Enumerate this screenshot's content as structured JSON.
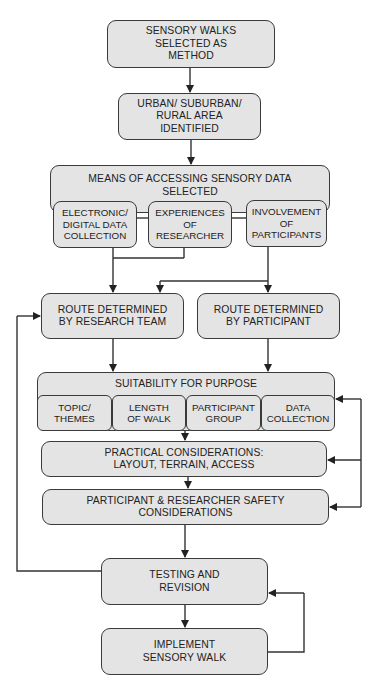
{
  "diagram": {
    "type": "flowchart",
    "nodes": {
      "n1": "SENSORY WALKS\nSELECTED AS\nMETHOD",
      "n2": "URBAN/ SUBURBAN/\nRURAL AREA\nIDENTIFIED",
      "n3": "MEANS OF ACCESSING SENSORY DATA\nSELECTED",
      "n3a": "ELECTRONIC/\nDIGITAL DATA\nCOLLECTION",
      "n3b": "EXPERIENCES\nOF\nRESEARCHER",
      "n3c": "INVOLVEMENT\nOF\nPARTICIPANTS",
      "n4a": "ROUTE DETERMINED\nBY RESEARCH TEAM",
      "n4b": "ROUTE DETERMINED\nBY PARTICIPANT",
      "n5": "SUITABILITY FOR PURPOSE",
      "n5a": "TOPIC/\nTHEMES",
      "n5b": "LENGTH\nOF WALK",
      "n5c": "PARTICIPANT\nGROUP",
      "n5d": "DATA\nCOLLECTION",
      "n6": "PRACTICAL CONSIDERATIONS:\nLAYOUT, TERRAIN, ACCESS",
      "n7": "PARTICIPANT & RESEARCHER SAFETY\nCONSIDERATIONS",
      "n8": "TESTING AND\nREVISION",
      "n9": "IMPLEMENT\nSENSORY WALK"
    },
    "edges": [
      [
        "n1",
        "n2"
      ],
      [
        "n2",
        "n3"
      ],
      [
        "n3a",
        "n4a"
      ],
      [
        "n3b",
        "n4a"
      ],
      [
        "n3c",
        "n4a"
      ],
      [
        "n3c",
        "n4b"
      ],
      [
        "n4a",
        "n5"
      ],
      [
        "n4b",
        "n5"
      ],
      [
        "n5",
        "n6"
      ],
      [
        "n6",
        "n7"
      ],
      [
        "n7",
        "n8"
      ],
      [
        "n8",
        "n9"
      ],
      [
        "n8",
        "n4a"
      ],
      [
        "n9",
        "n8"
      ],
      [
        "n6",
        "n5d"
      ],
      [
        "n6",
        "n7"
      ]
    ],
    "colors": {
      "fill": "#e4e4e4",
      "stroke": "#3a3a3a",
      "background": "#ffffff"
    }
  }
}
